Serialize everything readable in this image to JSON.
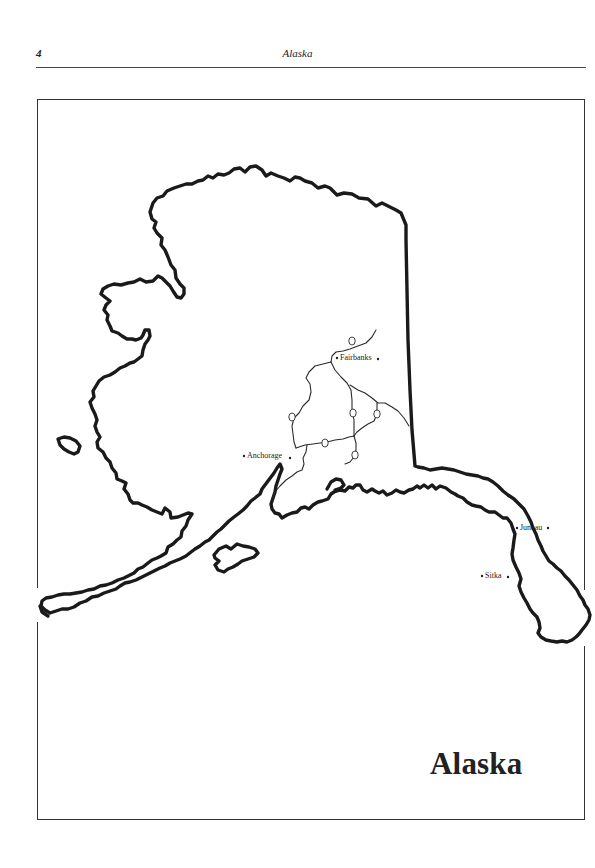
{
  "header": {
    "page_number": "4",
    "running_title": "Alaska"
  },
  "map": {
    "title": "Alaska",
    "cities": [
      {
        "name": "Fairbanks",
        "label": "Fairbanks"
      },
      {
        "name": "Anchorage",
        "label": "Anchorage"
      },
      {
        "name": "Juneau",
        "label": "Juneau"
      },
      {
        "name": "Sitka",
        "label": "Sitka"
      }
    ],
    "highway_shields": [
      "2",
      "3",
      "4",
      "1",
      "2",
      "4"
    ],
    "colors": {
      "outline": "#1a1a1a",
      "roads": "#2a2a2a",
      "frame": "#333333",
      "background": "#ffffff"
    }
  }
}
